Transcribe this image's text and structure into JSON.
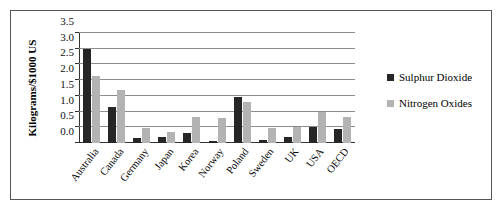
{
  "chart_data": {
    "type": "bar",
    "title": "",
    "xlabel": "",
    "ylabel": "Kilograms/$1000 US",
    "ylim": [
      0.0,
      3.5
    ],
    "ytick_labels": [
      "0.0",
      "0.5",
      "1.0",
      "1.5",
      "2.0",
      "2.5",
      "3.0",
      "3.5"
    ],
    "ytick_values": [
      0.0,
      0.5,
      1.0,
      1.5,
      2.0,
      2.5,
      3.0,
      3.5
    ],
    "grid": true,
    "legend_position": "right",
    "categories": [
      "Australia",
      "Canada",
      "Germany",
      "Japan",
      "Korea",
      "Norway",
      "Poland",
      "Sweden",
      "UK",
      "USA",
      "OECD"
    ],
    "series": [
      {
        "name": "Sulphur Dioxide",
        "color": "#262626",
        "values": [
          3.0,
          1.15,
          0.16,
          0.19,
          0.33,
          0.08,
          1.47,
          0.1,
          0.19,
          0.5,
          0.45
        ]
      },
      {
        "name": "Nitrogen Oxides",
        "color": "#b3b3b3",
        "values": [
          2.13,
          1.7,
          0.49,
          0.36,
          0.83,
          0.79,
          1.29,
          0.48,
          0.52,
          0.98,
          0.82
        ]
      }
    ]
  }
}
